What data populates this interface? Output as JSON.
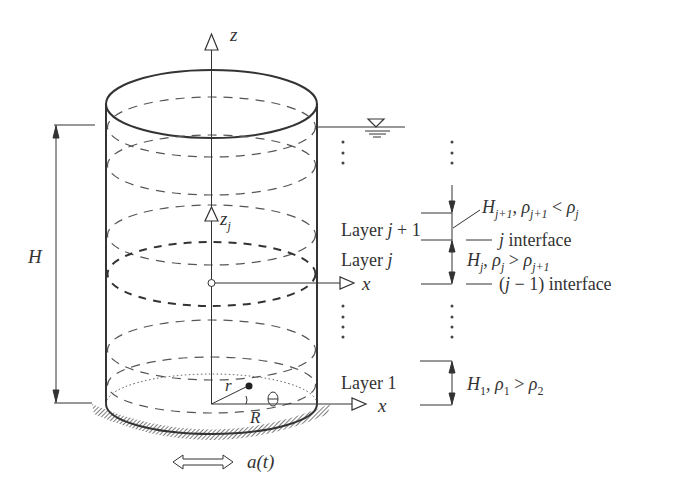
{
  "diagram": {
    "type": "cylindrical tank with layered stratified fluid",
    "axes": {
      "z": "z",
      "zj": "z",
      "zj_sub": "j",
      "x_top": "x",
      "x_bottom": "x"
    },
    "dimensions": {
      "height": "H",
      "radius": "R",
      "r": "r",
      "theta": "θ"
    },
    "excitation": {
      "label": "a(t)"
    },
    "layers": {
      "layer_j1": {
        "label_prefix": "Layer ",
        "label_j": "j",
        "label_suffix": " + 1"
      },
      "layer_j": {
        "label_prefix": "Layer ",
        "label_j": "j"
      },
      "layer_1": {
        "label": "Layer 1"
      }
    },
    "annotations": {
      "h_j1": "H_{j+1}, ρ_{j+1} < ρ_j",
      "j_interface": "j interface",
      "h_j": "H_j, ρ_j > ρ_{j+1}",
      "jm1_interface": "(j − 1) interface",
      "h_1": "H_1, ρ_1 > ρ_2"
    },
    "colors": {
      "line": "#333333",
      "dash": "#555555",
      "hatch": "#555555"
    }
  }
}
